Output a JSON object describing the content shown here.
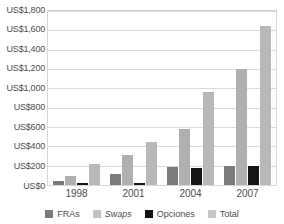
{
  "chart_data": {
    "type": "bar",
    "title": "",
    "xlabel": "",
    "ylabel": "",
    "categories": [
      "1998",
      "2001",
      "2004",
      "2007"
    ],
    "series": [
      {
        "name": "FRAs",
        "values": [
          40,
          110,
          185,
          200
        ],
        "color": "#7b7b7b"
      },
      {
        "name": "Swaps",
        "values": [
          90,
          310,
          580,
          1200
        ],
        "color": "#b0b0b0"
      },
      {
        "name": "Opciones",
        "values": [
          20,
          20,
          175,
          195
        ],
        "color": "#151515"
      },
      {
        "name": "Total",
        "values": [
          220,
          440,
          960,
          1650
        ],
        "color": "#b8b8b8"
      }
    ],
    "ylim": [
      0,
      1800
    ],
    "ytick_values": [
      0,
      200,
      400,
      600,
      800,
      1000,
      1200,
      1400,
      1600,
      1800
    ],
    "ytick_labels": [
      "US$0",
      "US$200",
      "US$400",
      "US$600",
      "US$800",
      "US$1,000",
      "US$1,200",
      "US$1,400",
      "US$1,600",
      "US$1,800"
    ],
    "grid": true,
    "legend_position": "bottom",
    "legend": [
      {
        "label": "FRAs",
        "swatch": "fras",
        "italic": false
      },
      {
        "label": "Swaps",
        "swatch": "swaps",
        "italic": true
      },
      {
        "label": "Opciones",
        "swatch": "opc",
        "italic": false
      },
      {
        "label": "Total",
        "swatch": "total",
        "italic": false
      }
    ]
  }
}
